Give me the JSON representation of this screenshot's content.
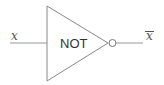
{
  "diagram": {
    "type": "logic-gate",
    "gate": {
      "label": "NOT",
      "shape": "triangle-with-inversion-bubble"
    },
    "input": {
      "label": "x"
    },
    "output": {
      "label": "x",
      "overline": true
    },
    "colors": {
      "stroke": "#888888",
      "text": "#333333",
      "background": "#ffffff"
    }
  }
}
